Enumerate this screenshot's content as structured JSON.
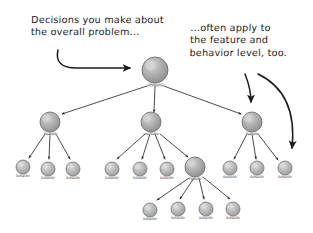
{
  "figure": {
    "kind": "hierarchy-tree-diagram",
    "background_color": "#ffffff",
    "ink_color": "#1b1b1b",
    "node_fill_color": "#a9a9a9",
    "node_highlight_color": "#cfcfcf",
    "node_stroke_color": "#6b6b6b"
  },
  "annotations": {
    "left": {
      "name": "decisions-callout",
      "line1": "Decisions you make about",
      "line2": "the overall problem...",
      "text": "Decisions you make about\nthe overall problem..."
    },
    "right": {
      "name": "feature-behavior-callout",
      "line1": "...often apply to",
      "line2": "the feature and",
      "line3": "behavior level, too.",
      "text": "...often apply to\nthe feature and\nbehavior level, too."
    }
  },
  "nodes": {
    "root": {
      "label": "Project",
      "x": 155,
      "y": 70,
      "r": 13,
      "level": 0
    },
    "level1": [
      {
        "label": "Feature",
        "x": 50,
        "y": 122,
        "r": 10,
        "level": 1
      },
      {
        "label": "Use Case",
        "x": 151,
        "y": 122,
        "r": 10,
        "level": 1
      },
      {
        "label": "Feature",
        "x": 252,
        "y": 122,
        "r": 10,
        "level": 1
      }
    ],
    "level2": [
      {
        "label": "Behavior",
        "x": 23,
        "y": 167,
        "r": 7,
        "level": 2,
        "branch": "left"
      },
      {
        "label": "Behavior",
        "x": 48,
        "y": 169,
        "r": 7,
        "level": 2,
        "branch": "left"
      },
      {
        "label": "Behavior",
        "x": 73,
        "y": 169,
        "r": 7,
        "level": 2,
        "branch": "left"
      },
      {
        "label": "Behavior",
        "x": 112,
        "y": 169,
        "r": 7,
        "level": 2,
        "branch": "middle"
      },
      {
        "label": "Behavior",
        "x": 140,
        "y": 169,
        "r": 7,
        "level": 2,
        "branch": "middle"
      },
      {
        "label": "Behavior",
        "x": 167,
        "y": 169,
        "r": 7,
        "level": 2,
        "branch": "middle"
      },
      {
        "label": "Feature",
        "x": 195,
        "y": 167,
        "r": 10,
        "level": 2,
        "branch": "middle"
      },
      {
        "label": "Behavior",
        "x": 230,
        "y": 168,
        "r": 7,
        "level": 2,
        "branch": "right"
      },
      {
        "label": "Behavior",
        "x": 257,
        "y": 168,
        "r": 7,
        "level": 2,
        "branch": "right"
      },
      {
        "label": "Behavior",
        "x": 285,
        "y": 168,
        "r": 7,
        "level": 2,
        "branch": "right"
      }
    ],
    "level3": [
      {
        "label": "Behavior",
        "x": 150,
        "y": 210,
        "r": 7,
        "level": 3,
        "branch": "sub-feature"
      },
      {
        "label": "Behavior",
        "x": 178,
        "y": 209,
        "r": 7,
        "level": 3,
        "branch": "sub-feature"
      },
      {
        "label": "Behavior",
        "x": 206,
        "y": 209,
        "r": 7,
        "level": 3,
        "branch": "sub-feature"
      },
      {
        "label": "Behavior",
        "x": 233,
        "y": 209,
        "r": 7,
        "level": 3,
        "branch": "sub-feature"
      }
    ]
  },
  "connectors": {
    "from_root": 3,
    "from_left_feature": 3,
    "from_use_case": 4,
    "from_right_feature": 3,
    "from_sub_feature": 4
  },
  "callout_arrows": [
    {
      "name": "left-callout-arrow",
      "from": "decisions-callout",
      "to": "root"
    },
    {
      "name": "right-callout-arrow-short",
      "from": "feature-behavior-callout",
      "to": "right-feature-node"
    },
    {
      "name": "right-callout-arrow-long",
      "from": "feature-behavior-callout",
      "to": "rightmost-behavior-node"
    }
  ]
}
